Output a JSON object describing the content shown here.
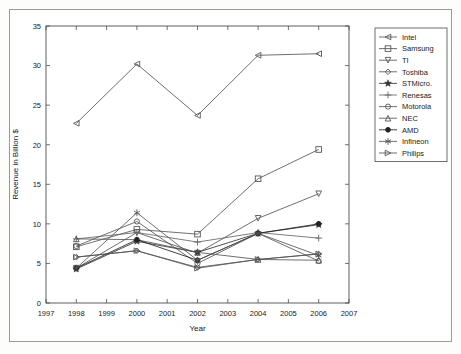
{
  "chart_data": {
    "type": "line",
    "title": "",
    "xlabel": "Year",
    "ylabel": "Revenue in Billion $",
    "x": [
      1998,
      2000,
      2002,
      2004,
      2006
    ],
    "xlim": [
      1997,
      2007
    ],
    "ylim": [
      0,
      35
    ],
    "xticks": [
      1997,
      1998,
      1999,
      2000,
      2001,
      2002,
      2003,
      2004,
      2005,
      2006,
      2007
    ],
    "yticks": [
      0,
      5,
      10,
      15,
      20,
      25,
      30,
      35
    ],
    "grid": false,
    "legend_position": "right-outside",
    "series": [
      {
        "name": "Intel",
        "marker": "left-triangle",
        "values": [
          22.7,
          30.2,
          23.7,
          31.3,
          31.5
        ],
        "color": "#555555"
      },
      {
        "name": "Samsung",
        "marker": "square",
        "values": [
          7.1,
          9.3,
          8.7,
          15.7,
          19.4
        ],
        "color": "#555555"
      },
      {
        "name": "TI",
        "marker": "down-triangle",
        "values": [
          4.4,
          8.9,
          6.3,
          10.7,
          13.8
        ],
        "color": "#555555"
      },
      {
        "name": "Toshiba",
        "marker": "diamond",
        "values": [
          5.8,
          6.6,
          4.5,
          5.5,
          6.2
        ],
        "color": "#555555"
      },
      {
        "name": "STMicro.",
        "marker": "star",
        "values": [
          4.3,
          7.8,
          6.4,
          8.8,
          9.9
        ],
        "color": "#333333"
      },
      {
        "name": "Renesas",
        "marker": "plus",
        "values": [
          8.1,
          8.9,
          7.7,
          8.9,
          8.2
        ],
        "color": "#666666"
      },
      {
        "name": "Motorola",
        "marker": "circle",
        "values": [
          7.2,
          10.3,
          5.0,
          8.8,
          5.3
        ],
        "color": "#555555"
      },
      {
        "name": "NEC",
        "marker": "up-triangle",
        "values": [
          8.1,
          8.0,
          6.4,
          5.5,
          5.4
        ],
        "color": "#555555"
      },
      {
        "name": "AMD",
        "marker": "filled-circle",
        "values": [
          4.4,
          8.0,
          5.4,
          8.8,
          10.0
        ],
        "color": "#222222"
      },
      {
        "name": "Infineon",
        "marker": "asterisk",
        "values": [
          4.4,
          11.4,
          5.4,
          8.8,
          6.0
        ],
        "color": "#555555"
      },
      {
        "name": "Philips",
        "marker": "right-triangle",
        "values": [
          5.8,
          6.6,
          4.4,
          5.5,
          6.2
        ],
        "color": "#555555"
      }
    ]
  },
  "legend": {
    "entries": [
      "Intel",
      "Samsung",
      "TI",
      "Toshiba",
      "STMicro.",
      "Renesas",
      "Motorola",
      "NEC",
      "AMD",
      "Infineon",
      "Philips"
    ]
  }
}
